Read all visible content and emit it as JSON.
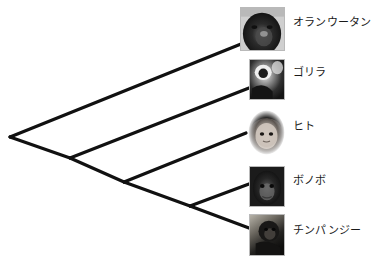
{
  "figure": {
    "width": 373,
    "height": 260,
    "background_color": "#ffffff",
    "line_color": "#111111",
    "line_width": 3.2,
    "label_color": "#1a1a1a"
  },
  "chart_data": {
    "type": "tree",
    "title": "",
    "orientation": "left-to-right cladogram with diagonal branches",
    "grid": false,
    "legend": "none",
    "taxa": [
      {
        "id": "orangutan",
        "label": "オランウータン",
        "tip_x": 246,
        "tip_y": 42,
        "thumb": {
          "x": 240,
          "y": 7,
          "w": 45,
          "h": 44,
          "shape": "square",
          "subject": "orangutan-face-photo"
        },
        "label_x": 293,
        "label_y": 23
      },
      {
        "id": "gorilla",
        "label": "ゴリラ",
        "tip_x": 249,
        "tip_y": 88,
        "thumb": {
          "x": 249,
          "y": 59,
          "w": 36,
          "h": 41,
          "shape": "square",
          "subject": "gorilla-face-photo"
        },
        "label_x": 293,
        "label_y": 73
      },
      {
        "id": "human",
        "label": "ヒト",
        "tip_x": 246,
        "tip_y": 133,
        "thumb": {
          "x": 248,
          "y": 110,
          "w": 37,
          "h": 45,
          "shape": "oval",
          "subject": "human-child-face-photo"
        },
        "label_x": 293,
        "label_y": 127
      },
      {
        "id": "bonobo",
        "label": "ボノボ",
        "tip_x": 249,
        "tip_y": 184,
        "thumb": {
          "x": 249,
          "y": 166,
          "w": 36,
          "h": 41,
          "shape": "square",
          "subject": "bonobo-face-photo"
        },
        "label_x": 293,
        "label_y": 181
      },
      {
        "id": "chimpanzee",
        "label": "チンパンジー",
        "tip_x": 249,
        "tip_y": 228,
        "thumb": {
          "x": 249,
          "y": 214,
          "w": 36,
          "h": 42,
          "shape": "square",
          "subject": "chimpanzee-photo"
        },
        "label_x": 293,
        "label_y": 231
      }
    ],
    "nodes": [
      {
        "id": "root",
        "x": 10,
        "y": 137,
        "children": [
          "orangutan",
          "node-african-apes"
        ]
      },
      {
        "id": "node-african-apes",
        "x": 70,
        "y": 158,
        "children": [
          "gorilla",
          "node-homininae"
        ]
      },
      {
        "id": "node-homininae",
        "x": 124,
        "y": 182,
        "children": [
          "human",
          "node-pan"
        ]
      },
      {
        "id": "node-pan",
        "x": 190,
        "y": 206,
        "children": [
          "bonobo",
          "chimpanzee"
        ]
      }
    ],
    "branches": [
      {
        "from": "root",
        "to": "orangutan",
        "x1": 10,
        "y1": 137,
        "x2": 246,
        "y2": 42
      },
      {
        "from": "root",
        "to": "node-african-apes",
        "x1": 10,
        "y1": 137,
        "x2": 70,
        "y2": 158
      },
      {
        "from": "node-african-apes",
        "to": "gorilla",
        "x1": 70,
        "y1": 158,
        "x2": 249,
        "y2": 88
      },
      {
        "from": "node-african-apes",
        "to": "node-homininae",
        "x1": 70,
        "y1": 158,
        "x2": 124,
        "y2": 182
      },
      {
        "from": "node-homininae",
        "to": "human",
        "x1": 124,
        "y1": 182,
        "x2": 246,
        "y2": 133
      },
      {
        "from": "node-homininae",
        "to": "node-pan",
        "x1": 124,
        "y1": 182,
        "x2": 190,
        "y2": 206
      },
      {
        "from": "node-pan",
        "to": "bonobo",
        "x1": 190,
        "y1": 206,
        "x2": 249,
        "y2": 184
      },
      {
        "from": "node-pan",
        "to": "chimpanzee",
        "x1": 190,
        "y1": 206,
        "x2": 249,
        "y2": 228
      }
    ]
  }
}
